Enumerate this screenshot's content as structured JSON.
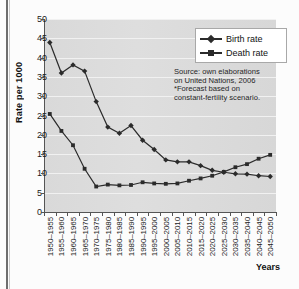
{
  "figure": {
    "cut_caption": "",
    "xaxis_title": "Years",
    "yaxis_title": "Rate per 1000"
  },
  "legend": {
    "position": "top-right",
    "items": [
      {
        "label": "Birth rate",
        "marker": "diamond-marker",
        "color": "#2b2b2b"
      },
      {
        "label": "Death rate",
        "marker": "square-marker",
        "color": "#2b2b2b"
      }
    ]
  },
  "source_note": {
    "line1": "Source: own elaborations",
    "line2": "on United Nations, 2006",
    "line3": "*Forecast based on",
    "line4": "constant-fertility scenario."
  },
  "chart_data": {
    "type": "line",
    "title": "",
    "subtitle": "",
    "xlabel": "Years",
    "ylabel": "Rate per 1000",
    "ylim": [
      0,
      50
    ],
    "yticks": [
      0,
      5,
      10,
      15,
      20,
      25,
      30,
      35,
      40,
      45,
      50
    ],
    "grid": true,
    "legend_position": "top-right",
    "categories": [
      "1950–1955",
      "1955–1960",
      "1960–1965",
      "1965–1970",
      "1970–1975",
      "1975–1980",
      "1980–1985",
      "1985–1990",
      "1990–1995",
      "1995–2000",
      "2000–2005",
      "2005–2010",
      "2010–2015",
      "2015–2020",
      "2020–2025",
      "2025–2030",
      "2030–2035",
      "2035–2040",
      "2040–2045",
      "2045–2050"
    ],
    "series": [
      {
        "name": "Birth rate",
        "marker": "diamond",
        "color": "#2b2b2b",
        "values": [
          43.9,
          36.0,
          38.1,
          36.5,
          28.6,
          22.0,
          20.4,
          22.4,
          18.6,
          16.2,
          13.5,
          13.0,
          13.0,
          12.0,
          10.8,
          10.3,
          9.9,
          9.8,
          9.4,
          9.2
        ]
      },
      {
        "name": "Death rate",
        "marker": "square",
        "color": "#2b2b2b",
        "values": [
          25.4,
          21.0,
          17.3,
          11.2,
          6.6,
          7.1,
          6.9,
          7.0,
          7.7,
          7.4,
          7.3,
          7.4,
          8.1,
          8.7,
          9.4,
          10.4,
          11.6,
          12.4,
          13.8,
          14.8
        ]
      }
    ],
    "annotations": [
      "Source: own elaborations",
      "on United Nations, 2006",
      "*Forecast based on",
      "constant-fertility scenario."
    ]
  }
}
